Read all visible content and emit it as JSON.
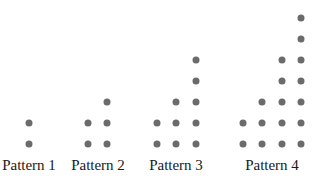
{
  "diagram": {
    "dot_color": "#6b6b6b",
    "patterns": [
      {
        "label": "Pattern 1",
        "label_x": 29,
        "columns": [
          {
            "x": 29,
            "height": 2
          }
        ]
      },
      {
        "label": "Pattern 2",
        "label_x": 98,
        "columns": [
          {
            "x": 88,
            "height": 2
          },
          {
            "x": 107,
            "height": 3
          }
        ]
      },
      {
        "label": "Pattern 3",
        "label_x": 176,
        "columns": [
          {
            "x": 157,
            "height": 2
          },
          {
            "x": 176,
            "height": 3
          },
          {
            "x": 196,
            "height": 5
          }
        ]
      },
      {
        "label": "Pattern 4",
        "label_x": 272,
        "columns": [
          {
            "x": 243,
            "height": 2
          },
          {
            "x": 262,
            "height": 3
          },
          {
            "x": 282,
            "height": 5
          },
          {
            "x": 301,
            "height": 7
          }
        ]
      }
    ],
    "row_bottom_y": 144,
    "row_spacing": 21
  }
}
